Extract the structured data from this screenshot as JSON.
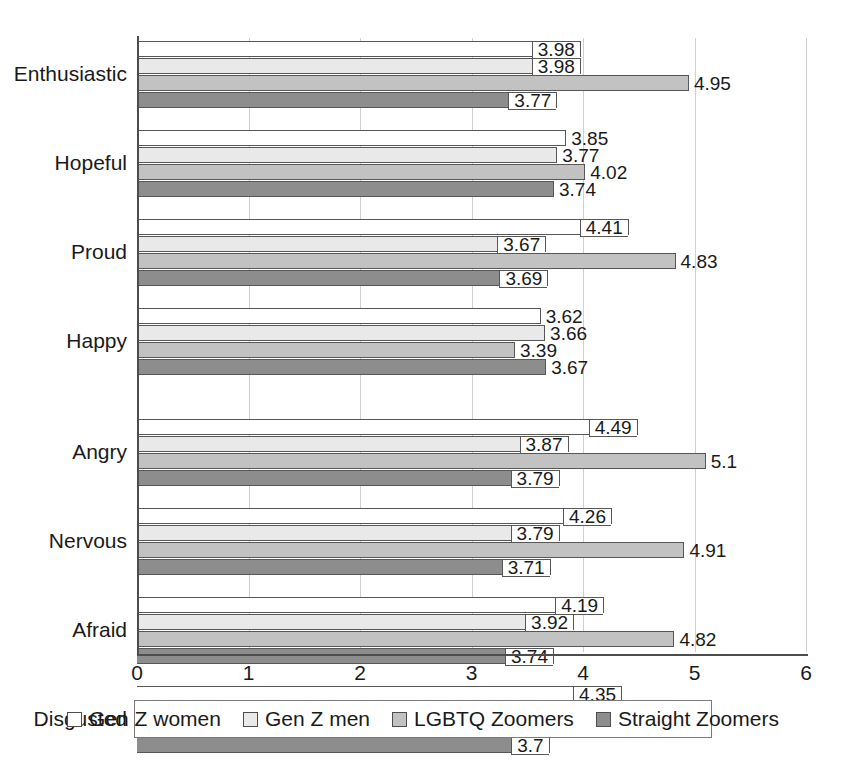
{
  "chart_data": {
    "type": "bar",
    "orientation": "horizontal",
    "title": "",
    "subtitle": "",
    "xlabel": "",
    "ylabel": "",
    "xlim": [
      0,
      6
    ],
    "xticks": [
      0,
      1,
      2,
      3,
      4,
      5,
      6
    ],
    "xtick_labels": [
      "0",
      "1",
      "2",
      "3",
      "4",
      "5",
      "6"
    ],
    "grid": true,
    "grid_axis": "x",
    "legend_position": "bottom",
    "categories": [
      "Enthusiastic",
      "Hopeful",
      "Proud",
      "Happy",
      "Angry",
      "Nervous",
      "Afraid",
      "Disgusted"
    ],
    "series": [
      {
        "name": "Gen Z women",
        "color": "#ffffff",
        "values": [
          3.98,
          3.85,
          4.41,
          3.62,
          4.49,
          4.26,
          4.19,
          4.35
        ],
        "labels": [
          "3.98",
          "3.85",
          "4.41",
          "3.62",
          "4.49",
          "4.26",
          "4.19",
          "4.35"
        ]
      },
      {
        "name": "Gen Z men",
        "color": "#e9e9e9",
        "values": [
          3.98,
          3.77,
          3.67,
          3.66,
          3.87,
          3.79,
          3.92,
          3.78
        ],
        "labels": [
          "3.98",
          "3.77",
          "3.67",
          "3.66",
          "3.87",
          "3.79",
          "3.92",
          "3.78"
        ]
      },
      {
        "name": "LGBTQ Zoomers",
        "color": "#c2c2c2",
        "values": [
          4.95,
          4.02,
          4.83,
          3.39,
          5.1,
          4.91,
          4.82,
          5
        ],
        "labels": [
          "4.95",
          "4.02",
          "4.83",
          "3.39",
          "5.1",
          "4.91",
          "4.82",
          "5"
        ]
      },
      {
        "name": "Straight Zoomers",
        "color": "#8d8d8d",
        "values": [
          3.77,
          3.74,
          3.69,
          3.67,
          3.79,
          3.71,
          3.74,
          3.7
        ],
        "labels": [
          "3.77",
          "3.74",
          "3.69",
          "3.67",
          "3.79",
          "3.71",
          "3.74",
          "3.7"
        ]
      }
    ]
  },
  "legend": {
    "items": [
      {
        "label": "Gen Z women"
      },
      {
        "label": "Gen Z men"
      },
      {
        "label": "LGBTQ Zoomers"
      },
      {
        "label": "Straight Zoomers"
      }
    ]
  }
}
